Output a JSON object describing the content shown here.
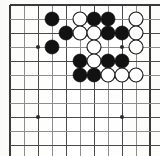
{
  "figure": {
    "kind": "go-board-diagram",
    "board_size_label": "partial board",
    "colors": {
      "background": "#fdfdfc",
      "grid": "#4a4a4a",
      "grid_faint": "#8d8d8d",
      "border": "#3a3a3a",
      "black_stone": "#121212",
      "white_stone": "#ffffff",
      "white_stone_outline": "#1c1c1c",
      "hoshi": "#2b2b2b"
    }
  },
  "geometry": {
    "width": 160,
    "height": 156,
    "origin_x": 10,
    "origin_y": 5,
    "spacing": 14,
    "cols": 11,
    "rows": 11,
    "stone_radius": 7,
    "hoshi_radius": 2
  },
  "chart_data": {
    "type": "table",
    "xlabel": "column (grid index)",
    "ylabel": "row (grid index)",
    "columns": [
      "col",
      "row",
      "color"
    ],
    "hoshi_points": [
      {
        "col": 2,
        "row": 3
      },
      {
        "col": 8,
        "row": 3
      },
      {
        "col": 2,
        "row": 8
      },
      {
        "col": 8,
        "row": 8
      }
    ],
    "stones": [
      {
        "col": 3,
        "row": 1,
        "color": "black"
      },
      {
        "col": 5,
        "row": 1,
        "color": "white"
      },
      {
        "col": 6,
        "row": 1,
        "color": "black"
      },
      {
        "col": 7,
        "row": 1,
        "color": "black"
      },
      {
        "col": 9,
        "row": 1,
        "color": "white"
      },
      {
        "col": 4,
        "row": 2,
        "color": "black"
      },
      {
        "col": 5,
        "row": 2,
        "color": "white"
      },
      {
        "col": 6,
        "row": 2,
        "color": "white"
      },
      {
        "col": 7,
        "row": 2,
        "color": "black"
      },
      {
        "col": 8,
        "row": 2,
        "color": "black"
      },
      {
        "col": 9,
        "row": 2,
        "color": "white"
      },
      {
        "col": 3,
        "row": 3,
        "color": "black"
      },
      {
        "col": 6,
        "row": 3,
        "color": "white"
      },
      {
        "col": 9,
        "row": 3,
        "color": "white"
      },
      {
        "col": 5,
        "row": 4,
        "color": "black"
      },
      {
        "col": 6,
        "row": 4,
        "color": "white"
      },
      {
        "col": 7,
        "row": 4,
        "color": "black"
      },
      {
        "col": 8,
        "row": 4,
        "color": "black"
      },
      {
        "col": 5,
        "row": 5,
        "color": "black"
      },
      {
        "col": 6,
        "row": 5,
        "color": "black"
      },
      {
        "col": 7,
        "row": 5,
        "color": "white"
      },
      {
        "col": 8,
        "row": 5,
        "color": "white"
      },
      {
        "col": 9,
        "row": 5,
        "color": "white"
      }
    ],
    "counts": {
      "black": 13,
      "white": 10,
      "total": 23
    },
    "grid": true,
    "legend": []
  }
}
